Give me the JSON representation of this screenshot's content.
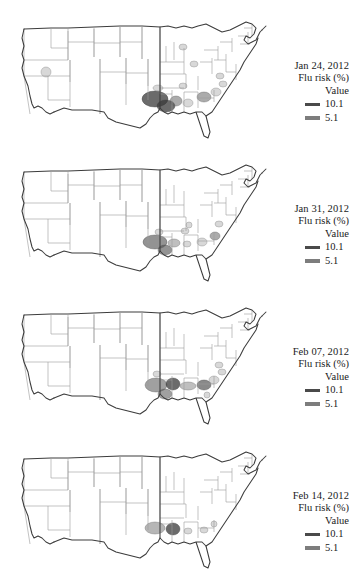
{
  "figure": {
    "type": "choropleth-map-series",
    "region": "United States (contiguous)",
    "measure": "Flu risk (%)",
    "panel_count": 4
  },
  "legend_common": {
    "subtitle": "Flu risk (%)",
    "value_label": "Value",
    "high_label": "10.1",
    "low_label": "5.1",
    "high_color": "#4a4a4a",
    "low_color": "#7d7d7d",
    "outline_color": "#3c3c3c",
    "state_border_color": "#9a9a9a",
    "background": "#ffffff"
  },
  "panels": [
    {
      "id": "panel-0",
      "title": "Jan 24, 2012",
      "subtitle": "Flu risk (%)",
      "value_label": "Value",
      "high_label": "10.1",
      "low_label": "5.1"
    },
    {
      "id": "panel-1",
      "title": "Jan 31, 2012",
      "subtitle": "Flu risk (%)",
      "value_label": "Value",
      "high_label": "10.1",
      "low_label": "5.1"
    },
    {
      "id": "panel-2",
      "title": "Feb 07, 2012",
      "subtitle": "Flu risk (%)",
      "value_label": "Value",
      "high_label": "10.1",
      "low_label": "5.1"
    },
    {
      "id": "panel-3",
      "title": "Feb 14, 2012",
      "subtitle": "Flu risk (%)",
      "value_label": "Value",
      "high_label": "10.1",
      "low_label": "5.1"
    }
  ],
  "chart_data": {
    "type": "heatmap",
    "xlabel": "",
    "ylabel": "",
    "legend_position": "right",
    "grid": false,
    "value_scale": {
      "low": 5.1,
      "high": 10.1,
      "units": "%"
    },
    "categories": [
      "Jan 24, 2012",
      "Jan 31, 2012",
      "Feb 07, 2012",
      "Feb 14, 2012"
    ],
    "series": [
      {
        "name": "Jan 24, 2012",
        "hotspots": [
          {
            "label": "Louisiana",
            "x": 147,
            "y": 97,
            "rx": 13,
            "ry": 8,
            "value": 10.1
          },
          {
            "label": "SE Louisiana",
            "x": 158,
            "y": 104,
            "rx": 9,
            "ry": 6,
            "value": 10.1
          },
          {
            "label": "Mississippi",
            "x": 168,
            "y": 99,
            "rx": 6,
            "ry": 5,
            "value": 7.5
          },
          {
            "label": "Alabama",
            "x": 180,
            "y": 101,
            "rx": 5,
            "ry": 4,
            "value": 5.1
          },
          {
            "label": "Georgia",
            "x": 196,
            "y": 95,
            "rx": 7,
            "ry": 5,
            "value": 7.5
          },
          {
            "label": "South Carolina",
            "x": 208,
            "y": 90,
            "rx": 5,
            "ry": 4,
            "value": 5.1
          },
          {
            "label": "Arkansas",
            "x": 150,
            "y": 86,
            "rx": 5,
            "ry": 3,
            "value": 5.1
          },
          {
            "label": "Tennessee",
            "x": 175,
            "y": 84,
            "rx": 4,
            "ry": 3,
            "value": 5.1
          },
          {
            "label": "North Carolina",
            "x": 215,
            "y": 82,
            "rx": 4,
            "ry": 3,
            "value": 5.1
          },
          {
            "label": "Virginia",
            "x": 212,
            "y": 74,
            "rx": 4,
            "ry": 3,
            "value": 5.1
          },
          {
            "label": "Ohio",
            "x": 186,
            "y": 62,
            "rx": 4,
            "ry": 3,
            "value": 5.1
          },
          {
            "label": "Michigan",
            "x": 175,
            "y": 45,
            "rx": 4,
            "ry": 3,
            "value": 5.1
          },
          {
            "label": "California",
            "x": 38,
            "y": 70,
            "rx": 5,
            "ry": 5,
            "value": 5.1
          }
        ]
      },
      {
        "name": "Jan 31, 2012",
        "hotspots": [
          {
            "label": "Louisiana",
            "x": 147,
            "y": 97,
            "rx": 12,
            "ry": 7,
            "value": 8.5
          },
          {
            "label": "SE Louisiana",
            "x": 157,
            "y": 105,
            "rx": 7,
            "ry": 5,
            "value": 8.5
          },
          {
            "label": "Mississippi",
            "x": 166,
            "y": 98,
            "rx": 6,
            "ry": 4,
            "value": 6.5
          },
          {
            "label": "Alabama",
            "x": 179,
            "y": 99,
            "rx": 4,
            "ry": 3,
            "value": 5.1
          },
          {
            "label": "Georgia",
            "x": 194,
            "y": 97,
            "rx": 5,
            "ry": 4,
            "value": 5.1
          },
          {
            "label": "South Carolina",
            "x": 207,
            "y": 91,
            "rx": 5,
            "ry": 4,
            "value": 7.5
          },
          {
            "label": "Arkansas",
            "x": 151,
            "y": 87,
            "rx": 4,
            "ry": 3,
            "value": 5.1
          },
          {
            "label": "Tennessee",
            "x": 177,
            "y": 86,
            "rx": 4,
            "ry": 3,
            "value": 5.1
          },
          {
            "label": "Virginia",
            "x": 211,
            "y": 79,
            "rx": 4,
            "ry": 3,
            "value": 5.1
          },
          {
            "label": "Kentucky",
            "x": 181,
            "y": 80,
            "rx": 3,
            "ry": 3,
            "value": 5.1
          }
        ]
      },
      {
        "name": "Feb 07, 2012",
        "hotspots": [
          {
            "label": "Louisiana",
            "x": 148,
            "y": 97,
            "rx": 11,
            "ry": 7,
            "value": 8.0
          },
          {
            "label": "SE Louisiana",
            "x": 157,
            "y": 106,
            "rx": 7,
            "ry": 5,
            "value": 8.0
          },
          {
            "label": "Mississippi",
            "x": 165,
            "y": 96,
            "rx": 7,
            "ry": 6,
            "value": 10.1
          },
          {
            "label": "Alabama",
            "x": 180,
            "y": 98,
            "rx": 8,
            "ry": 4,
            "value": 6.5
          },
          {
            "label": "Georgia",
            "x": 196,
            "y": 97,
            "rx": 7,
            "ry": 5,
            "value": 9.0
          },
          {
            "label": "South Carolina",
            "x": 206,
            "y": 92,
            "rx": 5,
            "ry": 4,
            "value": 5.1
          },
          {
            "label": "Arkansas",
            "x": 149,
            "y": 86,
            "rx": 4,
            "ry": 3,
            "value": 5.1
          },
          {
            "label": "North Carolina",
            "x": 214,
            "y": 84,
            "rx": 4,
            "ry": 3,
            "value": 5.1
          },
          {
            "label": "Virginia",
            "x": 211,
            "y": 77,
            "rx": 4,
            "ry": 3,
            "value": 5.1
          },
          {
            "label": "Florida",
            "x": 199,
            "y": 107,
            "rx": 3,
            "ry": 3,
            "value": 5.1
          }
        ]
      },
      {
        "name": "Feb 14, 2012",
        "hotspots": [
          {
            "label": "Louisiana",
            "x": 147,
            "y": 96,
            "rx": 10,
            "ry": 6,
            "value": 7.0
          },
          {
            "label": "Mississippi",
            "x": 165,
            "y": 97,
            "rx": 7,
            "ry": 6,
            "value": 10.1
          },
          {
            "label": "Alabama",
            "x": 180,
            "y": 99,
            "rx": 4,
            "ry": 3,
            "value": 5.1
          },
          {
            "label": "Georgia",
            "x": 196,
            "y": 98,
            "rx": 4,
            "ry": 3,
            "value": 5.1
          },
          {
            "label": "South Carolina",
            "x": 206,
            "y": 92,
            "rx": 3,
            "ry": 3,
            "value": 5.1
          }
        ]
      }
    ]
  }
}
